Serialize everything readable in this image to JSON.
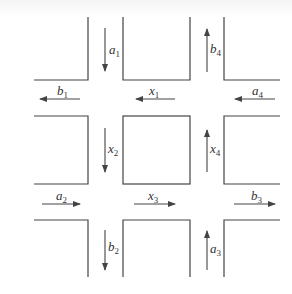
{
  "diagram": {
    "type": "traffic-network-intersections",
    "line_color": "#444444",
    "labels": {
      "a1": {
        "base": "a",
        "sub": "1",
        "direction": "down"
      },
      "b1": {
        "base": "b",
        "sub": "1",
        "direction": "left"
      },
      "x1": {
        "base": "x",
        "sub": "1",
        "direction": "left"
      },
      "a4": {
        "base": "a",
        "sub": "4",
        "direction": "left"
      },
      "b4": {
        "base": "b",
        "sub": "4",
        "direction": "up"
      },
      "x2": {
        "base": "x",
        "sub": "2",
        "direction": "down"
      },
      "x4": {
        "base": "x",
        "sub": "4",
        "direction": "up"
      },
      "a2": {
        "base": "a",
        "sub": "2",
        "direction": "right"
      },
      "x3": {
        "base": "x",
        "sub": "3",
        "direction": "right"
      },
      "b3": {
        "base": "b",
        "sub": "3",
        "direction": "right"
      },
      "b2": {
        "base": "b",
        "sub": "2",
        "direction": "down"
      },
      "a3": {
        "base": "a",
        "sub": "3",
        "direction": "up"
      }
    }
  }
}
